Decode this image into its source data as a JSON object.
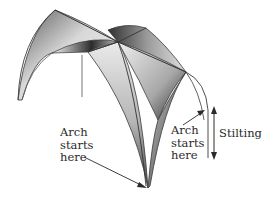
{
  "diagram": {
    "labels": {
      "left_arch_start": "Arch\nstarts\nhere",
      "right_arch_start": "Arch\nstarts\nhere",
      "stilting": "Stilting"
    },
    "colors": {
      "stroke": "#3a3a3a",
      "shade_dark": "#2e2e2e",
      "shade_mid": "#8a8a8a",
      "shade_light": "#eeeeee",
      "text": "#2a2a2a",
      "background": "#ffffff"
    }
  }
}
